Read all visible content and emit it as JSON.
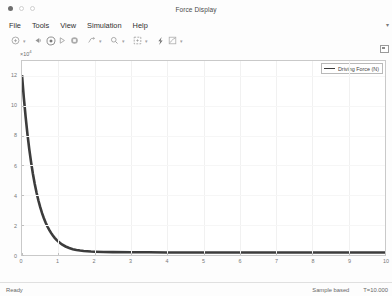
{
  "window": {
    "title": "Force Display",
    "controls": [
      "close",
      "minimize",
      "maximize"
    ]
  },
  "menu": {
    "items": [
      {
        "label": "File",
        "name": "menu-file"
      },
      {
        "label": "Tools",
        "name": "menu-tools"
      },
      {
        "label": "View",
        "name": "menu-view"
      },
      {
        "label": "Simulation",
        "name": "menu-simulation"
      },
      {
        "label": "Help",
        "name": "menu-help"
      }
    ],
    "overflow": "▾"
  },
  "toolbar": {
    "buttons": [
      {
        "name": "print-icon",
        "caret": true
      },
      {
        "name": "configuration-properties-icon",
        "caret": false
      },
      {
        "name": "run-icon",
        "caret": false
      },
      {
        "name": "step-forward-icon",
        "caret": false
      },
      {
        "name": "stop-icon",
        "caret": false
      },
      {
        "name": "trigger-icon",
        "caret": true
      },
      {
        "name": "zoom-in-icon",
        "caret": true
      },
      {
        "name": "autoscale-icon",
        "caret": true
      },
      {
        "name": "measurements-cursor-icon",
        "caret": false
      },
      {
        "name": "signal-statistics-icon",
        "caret": true
      }
    ]
  },
  "statusbar": {
    "ready": "Ready",
    "sample_mode": "Sample based",
    "time": "T=10.000"
  },
  "chart_data": {
    "type": "line",
    "title": "",
    "xlabel": "",
    "ylabel": "",
    "exponent_label": "×10",
    "exponent_power": "4",
    "xlim": [
      0,
      10
    ],
    "ylim": [
      0,
      13
    ],
    "xticks": [
      0,
      1,
      2,
      3,
      4,
      5,
      6,
      7,
      8,
      9,
      10
    ],
    "yticks": [
      0,
      2,
      4,
      6,
      8,
      10,
      12
    ],
    "grid": true,
    "legend": {
      "position": "top-right",
      "entries": [
        {
          "name": "Driving Force (N)",
          "color": "#3c3c3c"
        }
      ]
    },
    "series": [
      {
        "name": "Driving Force (N)",
        "color": "#3c3c3c",
        "x": [
          0.0,
          0.05,
          0.1,
          0.15,
          0.2,
          0.25,
          0.3,
          0.35,
          0.4,
          0.45,
          0.5,
          0.55,
          0.6,
          0.65,
          0.7,
          0.75,
          0.8,
          0.85,
          0.9,
          0.95,
          1.0,
          1.1,
          1.2,
          1.3,
          1.4,
          1.5,
          1.6,
          1.7,
          1.8,
          1.9,
          2.0,
          2.25,
          2.5,
          3.0,
          3.5,
          4.0,
          5.0,
          6.0,
          7.0,
          8.0,
          9.0,
          10.0
        ],
        "y": [
          12.05,
          10.55,
          9.25,
          8.1,
          7.1,
          6.22,
          5.45,
          4.78,
          4.19,
          3.67,
          3.22,
          2.82,
          2.48,
          2.18,
          1.91,
          1.68,
          1.48,
          1.3,
          1.15,
          1.01,
          0.9,
          0.71,
          0.57,
          0.47,
          0.39,
          0.34,
          0.3,
          0.27,
          0.25,
          0.23,
          0.22,
          0.2,
          0.19,
          0.18,
          0.18,
          0.17,
          0.17,
          0.17,
          0.17,
          0.17,
          0.17,
          0.17
        ]
      }
    ]
  }
}
